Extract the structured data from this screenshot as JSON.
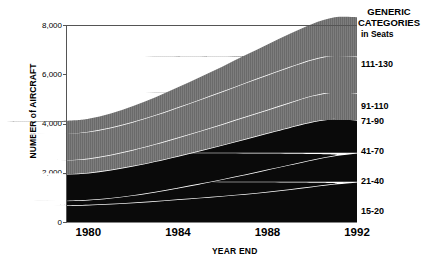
{
  "chart_data": {
    "type": "area",
    "stacked": true,
    "title": "",
    "xlabel": "YEAR END",
    "ylabel": "NUMBER of AIRCRAFT",
    "xlim": [
      1979,
      1992
    ],
    "ylim": [
      0,
      8000
    ],
    "xticks": [
      "1980",
      "1984",
      "1988",
      "1992"
    ],
    "xtick_values": [
      1980,
      1984,
      1988,
      1992
    ],
    "yticks": [
      "0",
      "2,000",
      "4,000",
      "6,000",
      "8,000"
    ],
    "ytick_values": [
      0,
      2000,
      4000,
      6000,
      8000
    ],
    "grid": false,
    "legend_position": "right",
    "legend_title": "GENERIC CATEGORIES",
    "legend_subtitle": "in Seats",
    "x": [
      1979,
      1980,
      1981,
      1982,
      1983,
      1984,
      1985,
      1986,
      1987,
      1988,
      1989,
      1990,
      1991,
      1992
    ],
    "series": [
      {
        "name": "15-20",
        "color": "#0a0a0a",
        "values": [
          700,
          720,
          760,
          810,
          870,
          940,
          1010,
          1080,
          1160,
          1250,
          1350,
          1460,
          1570,
          1650
        ]
      },
      {
        "name": "21-40",
        "color": "#0a0a0a",
        "values": [
          180,
          200,
          240,
          300,
          380,
          470,
          570,
          680,
          790,
          900,
          1000,
          1090,
          1150,
          1180
        ]
      },
      {
        "name": "41-70",
        "color": "#0a0a0a",
        "values": [
          1070,
          1100,
          1140,
          1190,
          1240,
          1290,
          1340,
          1390,
          1440,
          1480,
          1520,
          1540,
          1500,
          1330
        ]
      },
      {
        "name": "71-90",
        "color": "#7a7a7a",
        "values": [
          560,
          580,
          610,
          650,
          700,
          750,
          800,
          850,
          900,
          950,
          1000,
          1060,
          1090,
          1100
        ]
      },
      {
        "name": "91-110",
        "color": "#7a7a7a",
        "values": [
          1080,
          1090,
          1110,
          1140,
          1180,
          1230,
          1280,
          1330,
          1380,
          1420,
          1450,
          1470,
          1480,
          1480
        ]
      },
      {
        "name": "111-130",
        "color": "#7a7a7a",
        "values": [
          490,
          520,
          570,
          640,
          720,
          810,
          910,
          1010,
          1120,
          1230,
          1340,
          1440,
          1540,
          1600
        ]
      }
    ],
    "totals": [
      4080,
      4210,
      4430,
      4730,
      5090,
      5490,
      5910,
      6340,
      6790,
      7230,
      7660,
      8060,
      8330,
      8340
    ]
  },
  "axis": {
    "y_title": "NUMBER of AIRCRAFT",
    "x_title": "YEAR END"
  },
  "legend": {
    "title_line1": "GENERIC",
    "title_line2": "CATEGORIES",
    "subtitle": "in Seats",
    "entries": [
      {
        "label": "111-130",
        "top": 59
      },
      {
        "label": "91-110",
        "top": 101
      },
      {
        "label": "71-90",
        "top": 116
      },
      {
        "label": "41-70",
        "top": 146
      },
      {
        "label": "21-40",
        "top": 176
      },
      {
        "label": "15-20",
        "top": 206
      }
    ]
  },
  "colors": {
    "gray_fill": "#7a7a7a",
    "black_fill": "#0a0a0a",
    "separator": "#ffffff",
    "axis": "#555555",
    "background": "#ffffff"
  }
}
